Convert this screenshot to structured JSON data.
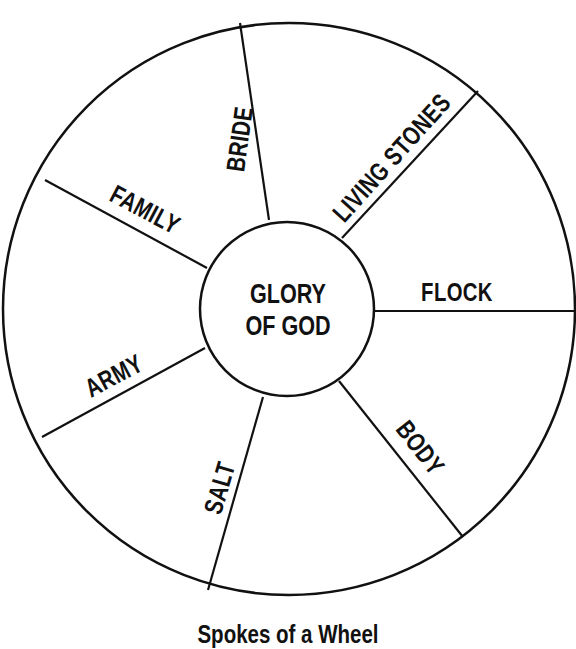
{
  "diagram": {
    "type": "wheel",
    "caption": "Spokes of a Wheel",
    "hub": {
      "line1": "GLORY",
      "line2": "OF GOD"
    },
    "spokes": [
      {
        "label": "BRIDE"
      },
      {
        "label": "LIVING STONES"
      },
      {
        "label": "FLOCK"
      },
      {
        "label": "BODY"
      },
      {
        "label": "SALT"
      },
      {
        "label": "ARMY"
      },
      {
        "label": "FAMILY"
      }
    ],
    "colors": {
      "line": "#111111",
      "background": "#ffffff",
      "text": "#111111"
    }
  }
}
